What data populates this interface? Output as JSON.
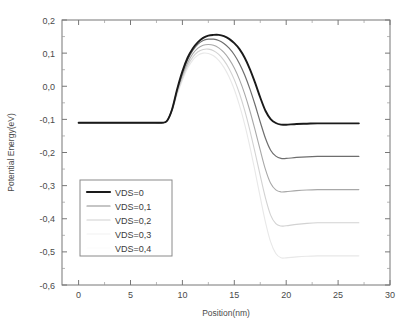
{
  "chart_data": {
    "type": "line",
    "title": "",
    "xlabel": "Position(nm)",
    "ylabel": "Potential Energy(eV)",
    "xlim": [
      -1.6,
      30
    ],
    "ylim": [
      -0.6,
      0.2
    ],
    "xticks": [
      0,
      5,
      10,
      15,
      20,
      25,
      30
    ],
    "xtick_labels": [
      "0",
      "5",
      "10",
      "15",
      "20",
      "25",
      "30"
    ],
    "yticks": [
      0.2,
      0.1,
      0.0,
      -0.1,
      -0.2,
      -0.3,
      -0.4,
      -0.5,
      -0.6
    ],
    "ytick_labels": [
      "0,2",
      "0,1",
      "0,0",
      "-0,1",
      "-0,2",
      "-0,3",
      "-0,4",
      "-0,5",
      "-0,6"
    ],
    "minor_ticks": true,
    "grid": false,
    "legend_position": "lower-left",
    "x": [
      0,
      1,
      2,
      3,
      4,
      5,
      6,
      7,
      8,
      8.5,
      9,
      9.5,
      10,
      10.5,
      11,
      11.5,
      12,
      12.5,
      13,
      13.5,
      14,
      14.5,
      15,
      15.5,
      16,
      16.5,
      17,
      17.5,
      18,
      18.5,
      19,
      19.5,
      20,
      21,
      22,
      23,
      24,
      25,
      26,
      27
    ],
    "series": [
      {
        "name": "VDS=0",
        "color": "#1a1a1a",
        "line_width": 1.9,
        "peak_value": 0.155,
        "peak_position": 13.4,
        "source_plateau": -0.11,
        "drain_plateau": -0.11,
        "values": [
          -0.11,
          -0.11,
          -0.11,
          -0.11,
          -0.11,
          -0.11,
          -0.11,
          -0.11,
          -0.11,
          -0.105,
          -0.07,
          -0.008,
          0.045,
          0.086,
          0.114,
          0.133,
          0.146,
          0.153,
          0.155,
          0.155,
          0.151,
          0.143,
          0.13,
          0.112,
          0.086,
          0.052,
          0.011,
          -0.034,
          -0.074,
          -0.099,
          -0.111,
          -0.116,
          -0.116,
          -0.114,
          -0.113,
          -0.112,
          -0.112,
          -0.112,
          -0.112,
          -0.112
        ]
      },
      {
        "name": "VDS=0,1",
        "color": "#6e6e6e",
        "line_width": 1.2,
        "peak_value": 0.142,
        "peak_position": 12.9,
        "source_plateau": -0.11,
        "drain_plateau": -0.21,
        "values": [
          -0.11,
          -0.11,
          -0.11,
          -0.11,
          -0.11,
          -0.11,
          -0.11,
          -0.11,
          -0.11,
          -0.105,
          -0.07,
          -0.01,
          0.04,
          0.08,
          0.108,
          0.127,
          0.138,
          0.142,
          0.142,
          0.138,
          0.129,
          0.115,
          0.095,
          0.068,
          0.034,
          -0.008,
          -0.056,
          -0.108,
          -0.157,
          -0.193,
          -0.211,
          -0.218,
          -0.218,
          -0.215,
          -0.213,
          -0.212,
          -0.212,
          -0.212,
          -0.212,
          -0.212
        ]
      },
      {
        "name": "VDS=0,2",
        "color": "#a8a8a8",
        "line_width": 1.1,
        "peak_value": 0.126,
        "peak_position": 12.5,
        "source_plateau": -0.11,
        "drain_plateau": -0.31,
        "values": [
          -0.11,
          -0.11,
          -0.11,
          -0.11,
          -0.11,
          -0.11,
          -0.11,
          -0.11,
          -0.11,
          -0.105,
          -0.072,
          -0.015,
          0.032,
          0.07,
          0.098,
          0.115,
          0.124,
          0.126,
          0.124,
          0.116,
          0.102,
          0.082,
          0.055,
          0.02,
          -0.023,
          -0.074,
          -0.132,
          -0.193,
          -0.251,
          -0.293,
          -0.313,
          -0.319,
          -0.318,
          -0.315,
          -0.313,
          -0.312,
          -0.312,
          -0.312,
          -0.312,
          -0.312
        ]
      },
      {
        "name": "VDS=0,3",
        "color": "#d2d2d2",
        "line_width": 1.1,
        "peak_value": 0.112,
        "peak_position": 12.2,
        "source_plateau": -0.11,
        "drain_plateau": -0.41,
        "values": [
          -0.11,
          -0.11,
          -0.11,
          -0.11,
          -0.11,
          -0.11,
          -0.11,
          -0.11,
          -0.11,
          -0.105,
          -0.074,
          -0.02,
          0.025,
          0.062,
          0.088,
          0.104,
          0.111,
          0.112,
          0.107,
          0.096,
          0.078,
          0.053,
          0.02,
          -0.022,
          -0.073,
          -0.133,
          -0.2,
          -0.27,
          -0.337,
          -0.389,
          -0.415,
          -0.422,
          -0.421,
          -0.417,
          -0.414,
          -0.412,
          -0.412,
          -0.412,
          -0.412,
          -0.412
        ]
      },
      {
        "name": "VDS=0,4",
        "color": "#e8e8e8",
        "line_width": 1.1,
        "peak_value": 0.1,
        "peak_position": 12.0,
        "source_plateau": -0.11,
        "drain_plateau": -0.51,
        "values": [
          -0.11,
          -0.11,
          -0.11,
          -0.11,
          -0.11,
          -0.11,
          -0.11,
          -0.11,
          -0.11,
          -0.105,
          -0.076,
          -0.025,
          0.018,
          0.054,
          0.079,
          0.094,
          0.1,
          0.099,
          0.092,
          0.078,
          0.057,
          0.028,
          -0.01,
          -0.058,
          -0.115,
          -0.182,
          -0.257,
          -0.335,
          -0.41,
          -0.47,
          -0.505,
          -0.518,
          -0.518,
          -0.515,
          -0.513,
          -0.512,
          -0.512,
          -0.512,
          -0.512,
          -0.512
        ]
      }
    ],
    "legend_entries": [
      {
        "label": "VDS=0",
        "color": "#1a1a1a",
        "line_width": 2.2
      },
      {
        "label": "VDS=0,1",
        "color": "#8c8c8c",
        "line_width": 1.2
      },
      {
        "label": "VDS=0,2",
        "color": "#cfcfcf",
        "line_width": 1.2
      },
      {
        "label": "VDS=0,3",
        "color": "#f2f2f2",
        "line_width": 1.2
      },
      {
        "label": "VDS=0,4",
        "color": "#fbfbfb",
        "line_width": 1.2
      }
    ]
  }
}
